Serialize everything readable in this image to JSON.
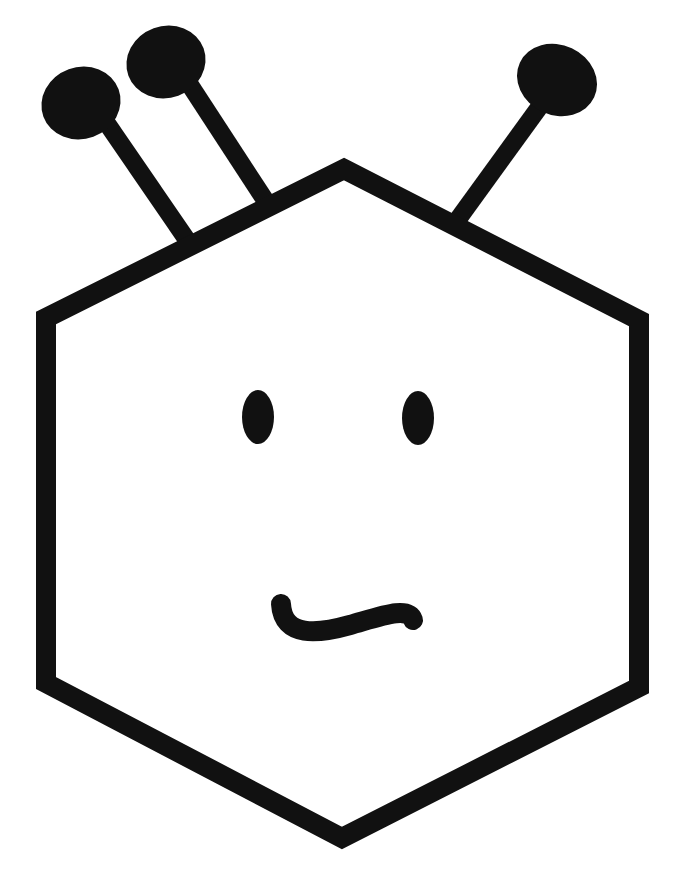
{
  "drawing": {
    "subject": "robot-face",
    "width": 680,
    "height": 873,
    "background": "#ffffff",
    "ink_color": "#111111",
    "hexagon": {
      "stroke_width": 20,
      "points": "344,169 639,320 639,687 342,838 46,683 46,318"
    },
    "antennae": [
      {
        "name": "antenna-left",
        "stem": {
          "x1": 106,
          "y1": 122,
          "x2": 187,
          "y2": 240
        },
        "head": {
          "cx": 81,
          "cy": 103,
          "rx": 40,
          "ry": 36,
          "rotate": -20
        }
      },
      {
        "name": "antenna-middle",
        "stem": {
          "x1": 188,
          "y1": 82,
          "x2": 265,
          "y2": 200
        },
        "head": {
          "cx": 166,
          "cy": 62,
          "rx": 40,
          "ry": 36,
          "rotate": -20
        }
      },
      {
        "name": "antenna-right",
        "stem": {
          "x1": 543,
          "y1": 102,
          "x2": 456,
          "y2": 222
        },
        "head": {
          "cx": 557,
          "cy": 80,
          "rx": 41,
          "ry": 35,
          "rotate": 25
        }
      }
    ],
    "stem_width": 18,
    "eyes": [
      {
        "name": "left-eye",
        "cx": 258,
        "cy": 417,
        "rx": 16,
        "ry": 27
      },
      {
        "name": "right-eye",
        "cx": 418,
        "cy": 418,
        "rx": 16,
        "ry": 27
      }
    ],
    "mouth": {
      "path": "M281,604 C283,638 318,634 350,625 C382,616 408,606 413,620",
      "stroke_width": 20
    }
  }
}
